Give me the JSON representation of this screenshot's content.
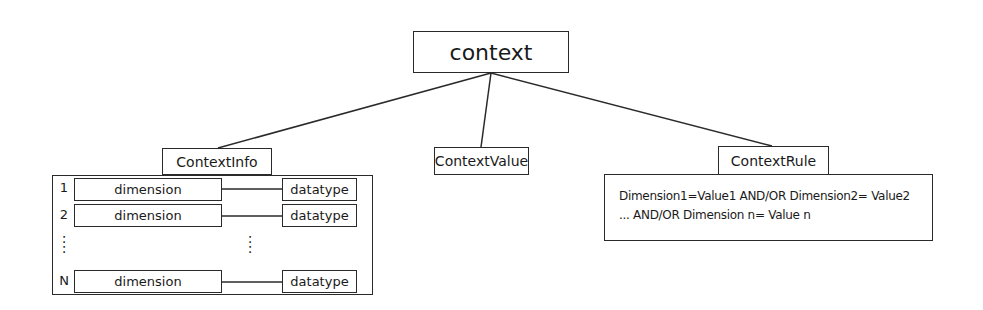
{
  "diagram": {
    "root": {
      "label": "context"
    },
    "children": [
      {
        "label": "ContextInfo",
        "rows": [
          {
            "index": "1",
            "dimension": "dimension",
            "datatype": "datatype"
          },
          {
            "index": "2",
            "dimension": "dimension",
            "datatype": "datatype"
          },
          {
            "index": "N",
            "dimension": "dimension",
            "datatype": "datatype"
          }
        ],
        "ellipsis": ":"
      },
      {
        "label": "ContextValue"
      },
      {
        "label": "ContextRule",
        "rule_lines": [
          "Dimension1=Value1 AND/OR Dimension2= Value2",
          "... AND/OR Dimension n= Value n"
        ]
      }
    ]
  }
}
